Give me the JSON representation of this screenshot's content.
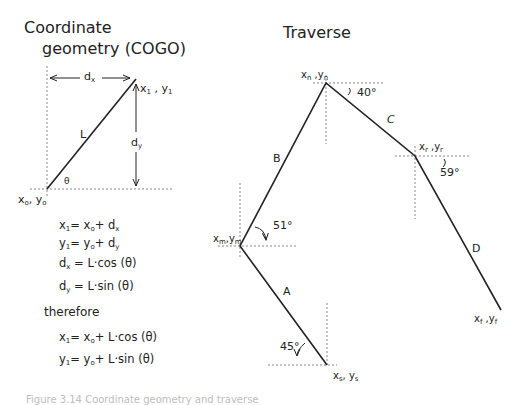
{
  "cogo": {
    "title_line1": "Coordinate",
    "title_line2": "geometry (COGO)",
    "labels": {
      "dx": "dx",
      "dy": "dy",
      "L": "L",
      "theta": "θ",
      "p1": "x1 , y1",
      "p0": "xo, yo"
    },
    "equations": [
      "x1 = xo + dx",
      "y1 = yo + dy",
      "dx = L·cos (θ)",
      "dy = L·sin (θ)"
    ],
    "therefore_label": "therefore",
    "result_equations": [
      "x1 = xo + L·cos (θ)",
      "y1 = yo + L·sin (θ)"
    ]
  },
  "traverse": {
    "title": "Traverse",
    "points": [
      {
        "id": "s",
        "label": "xs, ys"
      },
      {
        "id": "m",
        "label": "xm ,ym"
      },
      {
        "id": "n",
        "label": "xn ,yn"
      },
      {
        "id": "r",
        "label": "xr ,yr"
      },
      {
        "id": "f",
        "label": "xf ,yf"
      }
    ],
    "legs": [
      {
        "label": "A",
        "from": "s",
        "to": "m"
      },
      {
        "label": "B",
        "from": "m",
        "to": "n"
      },
      {
        "label": "C",
        "from": "n",
        "to": "r"
      },
      {
        "label": "D",
        "from": "r",
        "to": "f"
      }
    ],
    "angles": [
      {
        "at": "s",
        "value": "45°"
      },
      {
        "at": "m",
        "value": "51°"
      },
      {
        "at": "n",
        "value": "40°"
      },
      {
        "at": "r",
        "value": "59°"
      }
    ]
  },
  "caption": "Figure 3.14 Coordinate geometry and traverse"
}
